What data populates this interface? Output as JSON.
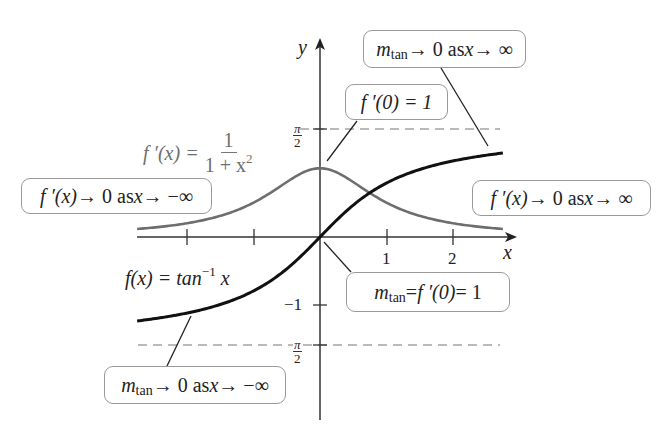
{
  "axes": {
    "x_label": "x",
    "y_label": "y",
    "x_ticks": [
      {
        "value": -2,
        "label": ""
      },
      {
        "value": -1,
        "label": ""
      },
      {
        "value": 1,
        "label": "1"
      },
      {
        "value": 2,
        "label": "2"
      }
    ],
    "y_ticks": [
      {
        "value": 1.5708,
        "label_num": "π",
        "label_den": "2"
      },
      {
        "value": -1,
        "label": "−1"
      },
      {
        "value": -1.5708,
        "label_num": "π",
        "label_den": "2"
      }
    ]
  },
  "asymptotes": [
    {
      "y": 1.5708,
      "style": "dashed",
      "label": "π/2"
    },
    {
      "y": -1.5708,
      "style": "dashed",
      "label": "−π/2"
    }
  ],
  "curves": {
    "arctan": {
      "label_lhs": "f(x) = tan",
      "label_sup": "−1",
      "label_var": "x",
      "color": "#111111"
    },
    "derivative": {
      "label_lhs": "f ′(x) = ",
      "label_num": "1",
      "label_den": "1 + x",
      "label_den_sup": "2",
      "color": "#6e6e6e"
    }
  },
  "callouts": {
    "mtan_inf": {
      "m": "m",
      "sub": "tan",
      "text": " → 0 as ",
      "var": "x",
      "tail": " → ∞"
    },
    "fprime_zero": {
      "text": "f ′(0) = 1"
    },
    "fprime_neg_inf": {
      "f": "f ′(x)",
      "text": " → 0 as ",
      "var": "x",
      "tail": " → −∞"
    },
    "fprime_pos_inf": {
      "f": "f ′(x)",
      "text": " → 0 as ",
      "var": "x",
      "tail": " → ∞"
    },
    "mtan_origin": {
      "m": "m",
      "sub": "tan",
      "text": " = ",
      "f": "f ′(0)",
      "tail": " = 1"
    },
    "mtan_neg_inf": {
      "m": "m",
      "sub": "tan",
      "text": " → 0 as ",
      "var": "x",
      "tail": " → −∞"
    }
  },
  "colors": {
    "axis": "#333333",
    "arctan_curve": "#111111",
    "derivative_curve": "#6e6e6e",
    "dashed_line": "#777777",
    "callout_border": "#9a9a9a"
  },
  "chart_data": {
    "type": "line",
    "title": "",
    "xlabel": "x",
    "ylabel": "y",
    "xlim": [
      -2.75,
      2.75
    ],
    "ylim": [
      -2.2,
      2.6
    ],
    "grid": false,
    "series": [
      {
        "name": "f(x) = tan^-1 x",
        "x": [
          -2.75,
          -2,
          -1,
          0,
          1,
          2,
          2.75
        ],
        "y": [
          -1.222,
          -1.107,
          -0.785,
          0,
          0.785,
          1.107,
          1.222
        ]
      },
      {
        "name": "f'(x) = 1/(1+x^2)",
        "x": [
          -2.75,
          -2,
          -1,
          0,
          1,
          2,
          2.75
        ],
        "y": [
          0.117,
          0.2,
          0.5,
          1,
          0.5,
          0.2,
          0.117
        ]
      }
    ],
    "reference_lines": [
      {
        "y": 1.5708,
        "label": "π/2",
        "style": "dashed"
      },
      {
        "y": -1.5708,
        "label": "−π/2",
        "style": "dashed"
      }
    ],
    "annotations": [
      "m_tan → 0 as x → ∞",
      "f ′(0) = 1",
      "f ′(x) → 0 as x → −∞",
      "f ′(x) → 0 as x → ∞",
      "m_tan = f ′(0) = 1",
      "m_tan → 0 as x → −∞",
      "f(x) = tan^-1 x",
      "f ′(x) = 1/(1 + x^2)"
    ]
  }
}
